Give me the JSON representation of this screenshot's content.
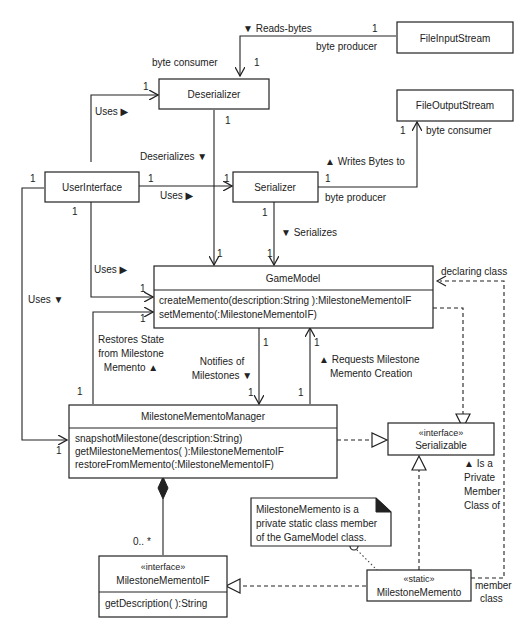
{
  "classes": {
    "file_input_stream": {
      "name": "FileInputStream"
    },
    "file_output_stream": {
      "name": "FileOutputStream"
    },
    "deserializer": {
      "name": "Deserializer"
    },
    "serializer": {
      "name": "Serializer"
    },
    "user_interface": {
      "name": "UserInterface"
    },
    "game_model": {
      "name": "GameModel",
      "methods": [
        "createMemento(description:String ):MilestoneMementoIF",
        "setMemento(:MilestoneMementoIF)"
      ]
    },
    "milestone_memento_manager": {
      "name": "MilestoneMementoManager",
      "methods": [
        "snapshotMilestone(description:String)",
        "getMilestoneMementos( ):MilestoneMementoIF",
        "restoreFromMemento(:MilestoneMementoIF)"
      ]
    },
    "serializable": {
      "stereotype": "«interface»",
      "name": "Serializable"
    },
    "milestone_memento_if": {
      "stereotype": "«interface»",
      "name": "MilestoneMementoIF",
      "methods": [
        "getDescription( ):String"
      ]
    },
    "milestone_memento": {
      "stereotype": "«static»",
      "name": "MilestoneMemento"
    }
  },
  "note": {
    "lines": [
      "MilestoneMemento is a",
      "private static class member",
      "of the GameModel class."
    ]
  },
  "associations": {
    "reads_bytes": {
      "label": "▼ Reads-bytes",
      "role_producer": "byte producer",
      "role_consumer": "byte consumer",
      "mult_src": "1",
      "mult_dst": "1"
    },
    "writes_bytes": {
      "label": "▲ Writes Bytes to",
      "role_producer": "byte producer",
      "role_consumer": "byte consumer",
      "mult_src": "1",
      "mult_dst": "1"
    },
    "ui_uses_deserializer": {
      "label": "Uses ▶",
      "mult": "1"
    },
    "ui_uses_serializer": {
      "label": "Uses ▶",
      "mult_src": "1",
      "mult_dst": "1"
    },
    "ui_uses_gamemodel": {
      "label": "Uses ▶",
      "mult_src": "1",
      "mult_dst": "1"
    },
    "ui_uses_manager": {
      "label": "Uses ▼",
      "mult_src": "1",
      "mult_dst": "1"
    },
    "deserializes": {
      "label": "Deserializes ▼",
      "mult_src": "1",
      "mult_dst": "1"
    },
    "serializes": {
      "label": "▼ Serializes",
      "mult_src": "1",
      "mult_dst": "1"
    },
    "restores_state": {
      "lines": [
        "Restores State",
        "from Milestone",
        "Memento ▲"
      ],
      "mult_src": "1",
      "mult_dst": "1"
    },
    "notifies": {
      "lines": [
        "Notifies of",
        "Milestones ▼"
      ],
      "mult_src": "1",
      "mult_dst": "1"
    },
    "requests": {
      "lines": [
        "▲ Requests Milestone",
        "Memento Creation"
      ],
      "mult_src": "1",
      "mult_dst": "1"
    },
    "declaring_class": {
      "label": "declaring class",
      "member_lines": [
        "member",
        "class"
      ],
      "private_lines": [
        "▲ Is a",
        "Private",
        "Member",
        "Class of"
      ]
    },
    "composition": {
      "mult": "0.. *"
    }
  }
}
